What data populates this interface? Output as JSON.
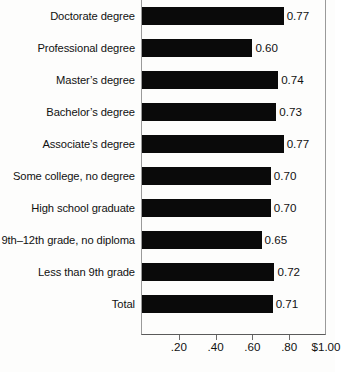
{
  "chart_data": {
    "type": "bar",
    "orientation": "horizontal",
    "title": "",
    "subtitle": "",
    "xlabel": "",
    "ylabel": "",
    "xlim": [
      0,
      1.0
    ],
    "grid": false,
    "legend": null,
    "bar_color": "#0a0a0a",
    "categories": [
      "Doctorate degree",
      "Professional degree",
      "Master’s degree",
      "Bachelor’s degree",
      "Associate’s degree",
      "Some college, no degree",
      "High school graduate",
      "9th–12th grade, no diploma",
      "Less than 9th grade",
      "Total"
    ],
    "values": [
      0.77,
      0.6,
      0.74,
      0.73,
      0.77,
      0.7,
      0.7,
      0.65,
      0.72,
      0.71
    ],
    "value_labels": [
      "0.77",
      "0.60",
      "0.74",
      "0.73",
      "0.77",
      "0.70",
      "0.70",
      "0.65",
      "0.72",
      "0.71"
    ],
    "xticks": [
      0.2,
      0.4,
      0.6,
      0.8,
      1.0
    ],
    "xticklabels": [
      ".20",
      ".40",
      ".60",
      ".80",
      "$1.00"
    ]
  }
}
